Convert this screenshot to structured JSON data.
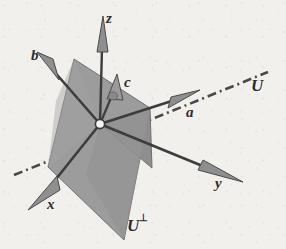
{
  "figure": {
    "kind": "vector-space-diagram",
    "caption_labels": {
      "z_axis": "z",
      "y_axis": "y",
      "x_axis": "x",
      "vector_a": "a",
      "vector_b": "b",
      "vector_c": "c",
      "subspace_u": "U",
      "subspace_u_perp_base": "U",
      "subspace_u_perp_sup": "⊥"
    },
    "colors": {
      "background": "#f2f0ec",
      "plane_fill": "#9a9a9a",
      "plane_fill_dark": "#8e8e8e",
      "stroke": "#3a3a3a",
      "arrow_fill": "#8f8f8f",
      "origin_fill": "#f6f4f0",
      "label_color": "#2b2b2b"
    },
    "geometry": {
      "origin": {
        "x": 100,
        "y": 124
      },
      "plane_u_perp_vertices": [
        {
          "x": 74,
          "y": 59
        },
        {
          "x": 150,
          "y": 108
        },
        {
          "x": 124,
          "y": 240
        },
        {
          "x": 48,
          "y": 167
        }
      ],
      "plane_wing_vertices": [
        {
          "x": 100,
          "y": 124
        },
        {
          "x": 150,
          "y": 108
        },
        {
          "x": 152,
          "y": 168
        }
      ],
      "axes": [
        {
          "name": "z",
          "from": {
            "x": 100,
            "y": 124
          },
          "to": {
            "x": 103,
            "y": 22
          }
        },
        {
          "name": "y",
          "from": {
            "x": 100,
            "y": 124
          },
          "to": {
            "x": 240,
            "y": 180
          }
        },
        {
          "name": "x",
          "from": {
            "x": 100,
            "y": 124
          },
          "to": {
            "x": 33,
            "y": 207
          }
        }
      ],
      "vectors": [
        {
          "name": "a",
          "from": {
            "x": 100,
            "y": 124
          },
          "to": {
            "x": 196,
            "y": 93
          }
        },
        {
          "name": "b",
          "from": {
            "x": 100,
            "y": 124
          },
          "to": {
            "x": 37,
            "y": 52
          }
        },
        {
          "name": "c",
          "from": {
            "x": 100,
            "y": 124
          },
          "to": {
            "x": 117,
            "y": 82
          }
        }
      ],
      "line_u": {
        "from": {
          "x": 14,
          "y": 175
        },
        "to": {
          "x": 268,
          "y": 72
        },
        "style": "dash-dot"
      }
    },
    "label_positions": {
      "z": {
        "x": 106,
        "y": 18
      },
      "y": {
        "x": 218,
        "y": 181
      },
      "x": {
        "x": 49,
        "y": 202
      },
      "a": {
        "x": 186,
        "y": 110
      },
      "b": {
        "x": 33,
        "y": 53
      },
      "c": {
        "x": 124,
        "y": 80
      },
      "U": {
        "x": 253,
        "y": 84
      },
      "U_perp": {
        "x": 128,
        "y": 221
      }
    }
  }
}
